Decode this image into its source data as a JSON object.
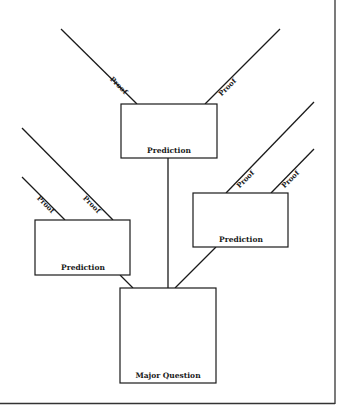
{
  "diagram": {
    "colors": {
      "line": "#1a1a1a",
      "background": "#ffffff",
      "frame": "#333333"
    },
    "major_question": {
      "label": "Major Question"
    },
    "predictions": [
      {
        "id": "top",
        "label": "Prediction",
        "proofs": [
          "Proof",
          "Proof"
        ]
      },
      {
        "id": "left",
        "label": "Prediction",
        "proofs": [
          "Proof",
          "Proof"
        ]
      },
      {
        "id": "right",
        "label": "Prediction",
        "proofs": [
          "Proof",
          "Proof"
        ]
      }
    ]
  }
}
